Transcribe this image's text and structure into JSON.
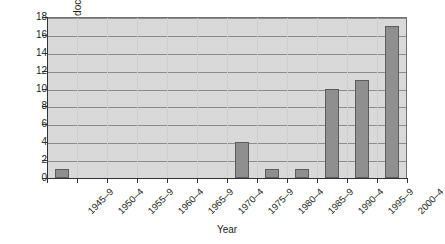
{
  "chart_data": {
    "type": "bar",
    "title": "",
    "xlabel": "Year",
    "ylabel": "Number of doctors",
    "categories": [
      "1945–9",
      "1950–4",
      "1955–9",
      "1960–4",
      "1965–9",
      "1970–4",
      "1975–9",
      "1980–4",
      "1985–9",
      "1990–4",
      "1995–9",
      "2000–4"
    ],
    "values": [
      1,
      0,
      0,
      0,
      0,
      0,
      4,
      1,
      1,
      10,
      11,
      17
    ],
    "ylim": [
      0,
      18
    ],
    "ytick_step": 2,
    "ytick_labels": [
      "0",
      "2",
      "4",
      "6",
      "8",
      "10",
      "12",
      "14",
      "16",
      "18"
    ],
    "grid": "horizontal",
    "legend": "none",
    "colors": {
      "bar_fill": "#8f8f8f",
      "bar_edge": "#5c5c5c",
      "plot_background": "#d9d9d9",
      "gridline": "#8c8c8c",
      "axis": "#333333",
      "text": "#231f20",
      "page_background": "#ffffff"
    }
  }
}
